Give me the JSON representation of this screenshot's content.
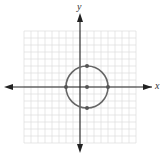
{
  "chart_data": {
    "type": "scatter",
    "title": "",
    "xlabel": "x",
    "ylabel": "y",
    "xlim": [
      -8,
      8
    ],
    "ylim": [
      -8,
      8
    ],
    "grid": true,
    "grid_step": 1,
    "tick_labels": false,
    "curves": [
      {
        "name": "circle",
        "shape": "circle",
        "center": [
          1,
          0
        ],
        "radius": 3,
        "color": "#666666"
      }
    ],
    "points": [
      {
        "x": 1,
        "y": 0,
        "label": "center"
      },
      {
        "x": -2,
        "y": 0
      },
      {
        "x": 4,
        "y": 0
      },
      {
        "x": 1,
        "y": 3
      },
      {
        "x": 1,
        "y": -3
      }
    ]
  },
  "axes": {
    "x_label": "x",
    "y_label": "y"
  },
  "colors": {
    "grid": "#dddddd",
    "axis": "#222222",
    "curve": "#666666",
    "point": "#555555"
  }
}
